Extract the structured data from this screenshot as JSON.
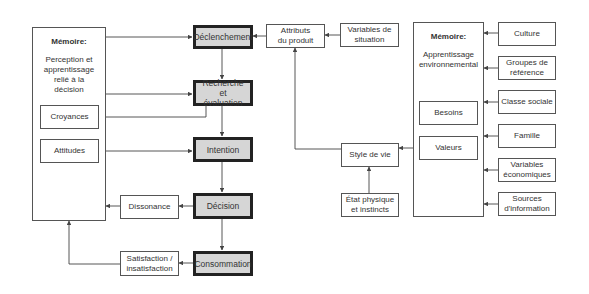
{
  "left_memory": {
    "title": "Mémoire:",
    "subtitle": "Perception et apprentissage relié à la décision",
    "items": [
      "Croyances",
      "Attitudes"
    ]
  },
  "stages": [
    "Déclenchement",
    "Recherche et évaluation",
    "Intention",
    "Décision",
    "Consommation"
  ],
  "feedback": {
    "dissonance": "Dissonance",
    "satisfaction": "Satisfaction / insatisfaction"
  },
  "middle": {
    "attributs": "Attributs du produit",
    "variables_situation": "Variables de situation",
    "style_de_vie": "Style de vie",
    "etat_physique": "État physique et instincts"
  },
  "right_memory": {
    "title": "Mémoire:",
    "subtitle": "Apprentissage environnemental",
    "items": [
      "Besoins",
      "Valeurs"
    ]
  },
  "external_factors": [
    "Culture",
    "Groupes de référence",
    "Classe sociale",
    "Famille",
    "Variables économiques",
    "Sources d'information"
  ],
  "colors": {
    "stage_fill": "#d6d6d6",
    "stage_border": "#222222",
    "line": "#444444"
  }
}
